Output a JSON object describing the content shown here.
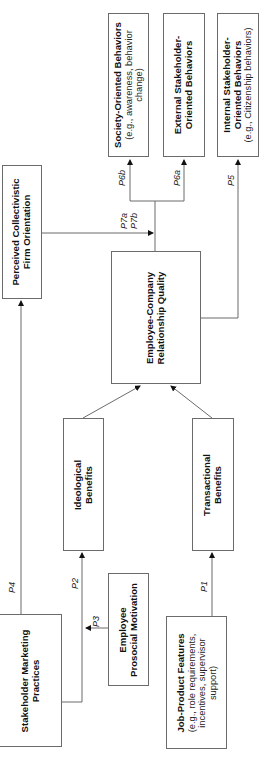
{
  "diagram": {
    "orientation": "rotated-90-ccw",
    "boxes": {
      "stakeholder_marketing": {
        "title": "Stakeholder Marketing",
        "title2": "Practices"
      },
      "job_product": {
        "title": "Job-Product Features",
        "sub1": "(e.g., role requirements,",
        "sub2": "incentives, supervisor",
        "sub3": "support)"
      },
      "prosocial": {
        "title": "Employee",
        "title2": "Prosocial Motivation"
      },
      "ideological": {
        "title": "Ideological",
        "title2": "Benefits"
      },
      "transactional": {
        "title": "Transactional",
        "title2": "Benefits"
      },
      "ecrq": {
        "title": "Employee-Company",
        "title2": "Relationship Quality"
      },
      "perceived": {
        "title": "Perceived Collectivistic",
        "title2": "Firm Orientation"
      },
      "society": {
        "title": "Society-Oriented Behaviors",
        "sub1": "(e.g., awareness, behavior",
        "sub2": "change)"
      },
      "external": {
        "title": "External Stakeholder-",
        "title2": "Oriented Behaviors"
      },
      "internal": {
        "title": "Internal Stakeholder-",
        "title2": "Oriented Behaviors",
        "sub1": "(e.g., Citizenship behaviors)"
      }
    },
    "paths": {
      "p1": "P1",
      "p2": "P2",
      "p3": "P3",
      "p4": "P4",
      "p5": "P5",
      "p6a": "P6a",
      "p6b": "P6b",
      "p7a": "P7a",
      "p7b": "P7b"
    },
    "colors": {
      "line": "#6b6b6b",
      "text": "#111111",
      "background": "#ffffff"
    }
  }
}
